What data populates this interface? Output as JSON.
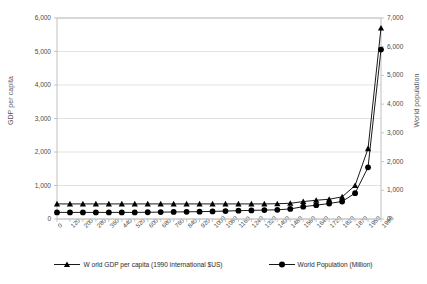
{
  "chart_data": {
    "type": "line",
    "title": "",
    "subtitle": "",
    "xlabel": "",
    "ylabel": "GDP per capita",
    "y2label": "World population",
    "ylim": [
      0,
      6000
    ],
    "y2lim": [
      0,
      7000
    ],
    "grid": true,
    "legend_position": "bottom",
    "y_ticks": [
      "0",
      "1,000",
      "2,000",
      "3,000",
      "4,000",
      "5,000",
      "6,000"
    ],
    "y_tick_values": [
      0,
      1000,
      2000,
      3000,
      4000,
      5000,
      6000
    ],
    "y2_ticks": [
      "0",
      "1,000",
      "2,000",
      "3,000",
      "4,000",
      "5,000",
      "6,000",
      "7,000"
    ],
    "y2_tick_values": [
      0,
      1000,
      2000,
      3000,
      4000,
      5000,
      6000,
      7000
    ],
    "categories": [
      "0",
      "120",
      "200",
      "280",
      "360",
      "440",
      "520",
      "600",
      "680",
      "760",
      "840",
      "920",
      "1000",
      "1080",
      "1160",
      "1240",
      "1320",
      "1400",
      "1480",
      "1560",
      "1640",
      "1720",
      "1820",
      "1870",
      "1950",
      "1998"
    ],
    "series": [
      {
        "name": "W orld GDP  per capita (1990 international $US)",
        "axis": "left",
        "marker": "triangle",
        "color": "#000000",
        "values": [
          450,
          450,
          450,
          450,
          450,
          450,
          450,
          450,
          450,
          450,
          450,
          450,
          450,
          450,
          450,
          450,
          450,
          455,
          470,
          520,
          560,
          590,
          660,
          1000,
          2100,
          5700
        ]
      },
      {
        "name": "World Population (Million)",
        "axis": "right",
        "marker": "circle",
        "color": "#000000",
        "values": [
          230,
          230,
          230,
          230,
          230,
          230,
          230,
          235,
          240,
          245,
          250,
          255,
          265,
          275,
          290,
          300,
          310,
          320,
          350,
          430,
          480,
          540,
          610,
          900,
          1800,
          5900
        ]
      }
    ]
  },
  "legend": {
    "items": [
      {
        "label": "W orld GDP  per capita (1990 international $US)",
        "marker": "triangle-marker"
      },
      {
        "label": "World Population (Million)",
        "marker": "circle-marker"
      }
    ]
  }
}
